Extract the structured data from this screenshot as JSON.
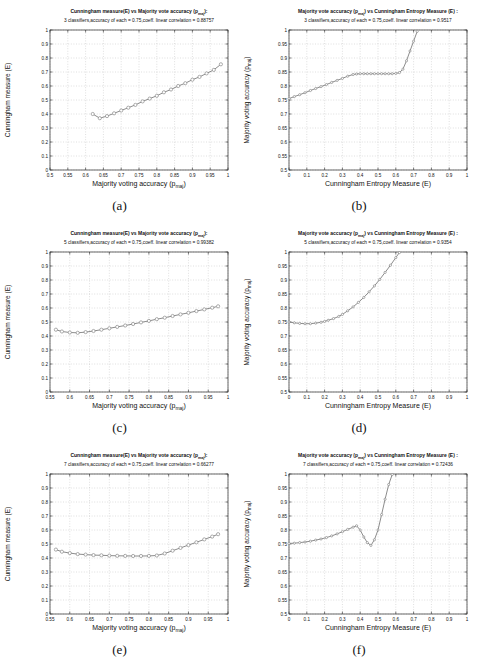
{
  "style": {
    "background": "#ffffff",
    "grid_color": "#bfbfbf",
    "axis_color": "#2a2a2a",
    "curve_color": "#6e6e6e",
    "marker_fill": "#ffffff",
    "marker_stroke": "#8a8a8a",
    "text_color": "#111111"
  },
  "chart_data": [
    {
      "type": "line",
      "caption": "(a)",
      "title_line1": "Cunningham measure(E) vs Majority vote accuracy (p_maj):",
      "title_line2": "3 classifiers,accuracy of each = 0.75,coeff. linear correlation = 0.88757",
      "xlabel": "Majority voting accuracy (p_maj)",
      "ylabel": "Cunningham measure (E)",
      "xlim": [
        0.5,
        1
      ],
      "ylim": [
        0,
        1
      ],
      "xticks": [
        0.5,
        0.55,
        0.6,
        0.65,
        0.7,
        0.75,
        0.8,
        0.85,
        0.9,
        0.95,
        1
      ],
      "yticks": [
        0,
        0.1,
        0.2,
        0.3,
        0.4,
        0.5,
        0.6,
        0.7,
        0.8,
        0.9,
        1
      ],
      "marker_r": 1.6,
      "points": [
        [
          0.62,
          0.4
        ],
        [
          0.64,
          0.37
        ],
        [
          0.66,
          0.385
        ],
        [
          0.68,
          0.405
        ],
        [
          0.7,
          0.425
        ],
        [
          0.72,
          0.445
        ],
        [
          0.74,
          0.465
        ],
        [
          0.76,
          0.49
        ],
        [
          0.78,
          0.51
        ],
        [
          0.8,
          0.53
        ],
        [
          0.82,
          0.555
        ],
        [
          0.84,
          0.575
        ],
        [
          0.86,
          0.6
        ],
        [
          0.88,
          0.62
        ],
        [
          0.9,
          0.645
        ],
        [
          0.92,
          0.665
        ],
        [
          0.94,
          0.69
        ],
        [
          0.96,
          0.715
        ],
        [
          0.98,
          0.755
        ]
      ]
    },
    {
      "type": "line",
      "caption": "(b)",
      "title_line1": "Majority vote accuracy (p_maj) vs Cunningham Entropy Measure (E) :",
      "title_line2": "3 classifiers,accuracy of each = 0.75,coeff. linear correlation = 0.9517",
      "xlabel": "Cunningham Entropy Measure (E)",
      "ylabel": "Majority voting accuracy (p_maj)",
      "xlim": [
        0,
        1
      ],
      "ylim": [
        0.5,
        1
      ],
      "xticks": [
        0,
        0.1,
        0.2,
        0.3,
        0.4,
        0.5,
        0.6,
        0.7,
        0.8,
        0.9,
        1
      ],
      "yticks": [
        0.5,
        0.55,
        0.6,
        0.65,
        0.7,
        0.75,
        0.8,
        0.85,
        0.9,
        0.95,
        1
      ],
      "marker_r": 1.1,
      "points": [
        [
          0,
          0.755
        ],
        [
          0.03,
          0.762
        ],
        [
          0.06,
          0.769
        ],
        [
          0.09,
          0.776
        ],
        [
          0.12,
          0.784
        ],
        [
          0.15,
          0.791
        ],
        [
          0.18,
          0.798
        ],
        [
          0.21,
          0.805
        ],
        [
          0.24,
          0.813
        ],
        [
          0.27,
          0.82
        ],
        [
          0.3,
          0.827
        ],
        [
          0.33,
          0.835
        ],
        [
          0.36,
          0.841
        ],
        [
          0.38,
          0.843
        ],
        [
          0.4,
          0.844
        ],
        [
          0.42,
          0.844
        ],
        [
          0.44,
          0.844
        ],
        [
          0.46,
          0.844
        ],
        [
          0.48,
          0.844
        ],
        [
          0.5,
          0.844
        ],
        [
          0.52,
          0.844
        ],
        [
          0.54,
          0.844
        ],
        [
          0.56,
          0.844
        ],
        [
          0.58,
          0.844
        ],
        [
          0.6,
          0.845
        ],
        [
          0.62,
          0.848
        ],
        [
          0.64,
          0.86
        ],
        [
          0.66,
          0.89
        ],
        [
          0.68,
          0.925
        ],
        [
          0.7,
          0.96
        ],
        [
          0.72,
          0.995
        ]
      ]
    },
    {
      "type": "line",
      "caption": "(c)",
      "title_line1": "Cunningham measure(E) vs Majority vote accuracy (p_maj):",
      "title_line2": "5 classifiers,accuracy of each = 0.75,coeff. linear correlation = 0.99382",
      "xlabel": "Majority voting accuracy (p_maj)",
      "ylabel": "Cunningham measure (E)",
      "xlim": [
        0.55,
        1
      ],
      "ylim": [
        0,
        1
      ],
      "xticks": [
        0.55,
        0.6,
        0.65,
        0.7,
        0.75,
        0.8,
        0.85,
        0.9,
        0.95,
        1
      ],
      "yticks": [
        0,
        0.1,
        0.2,
        0.3,
        0.4,
        0.5,
        0.6,
        0.7,
        0.8,
        0.9,
        1
      ],
      "marker_r": 1.6,
      "points": [
        [
          0.565,
          0.445
        ],
        [
          0.58,
          0.432
        ],
        [
          0.6,
          0.425
        ],
        [
          0.62,
          0.423
        ],
        [
          0.64,
          0.428
        ],
        [
          0.66,
          0.436
        ],
        [
          0.68,
          0.445
        ],
        [
          0.7,
          0.455
        ],
        [
          0.72,
          0.465
        ],
        [
          0.74,
          0.475
        ],
        [
          0.76,
          0.486
        ],
        [
          0.78,
          0.497
        ],
        [
          0.8,
          0.508
        ],
        [
          0.82,
          0.52
        ],
        [
          0.84,
          0.531
        ],
        [
          0.86,
          0.543
        ],
        [
          0.88,
          0.554
        ],
        [
          0.9,
          0.566
        ],
        [
          0.92,
          0.578
        ],
        [
          0.94,
          0.59
        ],
        [
          0.96,
          0.602
        ],
        [
          0.975,
          0.612
        ]
      ]
    },
    {
      "type": "line",
      "caption": "(d)",
      "title_line1": "Majority vote accuracy (p_maj) vs Cunningham Entropy Measure (E) :",
      "title_line2": "5 classifiers,accuracy of each = 0.75,coeff. linear correlation = 0.9354",
      "xlabel": "Cunningham Entropy Measure (E)",
      "ylabel": "Majority voting accuracy (p_maj)",
      "xlim": [
        0,
        1
      ],
      "ylim": [
        0.5,
        1
      ],
      "xticks": [
        0,
        0.1,
        0.2,
        0.3,
        0.4,
        0.5,
        0.6,
        0.7,
        0.8,
        0.9,
        1
      ],
      "yticks": [
        0.5,
        0.55,
        0.6,
        0.65,
        0.7,
        0.75,
        0.8,
        0.85,
        0.9,
        0.95,
        1
      ],
      "marker_r": 1.1,
      "points": [
        [
          0,
          0.75
        ],
        [
          0.03,
          0.747
        ],
        [
          0.06,
          0.745
        ],
        [
          0.09,
          0.744
        ],
        [
          0.12,
          0.744
        ],
        [
          0.15,
          0.746
        ],
        [
          0.18,
          0.749
        ],
        [
          0.2,
          0.752
        ],
        [
          0.22,
          0.756
        ],
        [
          0.25,
          0.762
        ],
        [
          0.28,
          0.77
        ],
        [
          0.3,
          0.777
        ],
        [
          0.33,
          0.79
        ],
        [
          0.36,
          0.804
        ],
        [
          0.39,
          0.82
        ],
        [
          0.42,
          0.838
        ],
        [
          0.45,
          0.858
        ],
        [
          0.48,
          0.879
        ],
        [
          0.51,
          0.902
        ],
        [
          0.54,
          0.927
        ],
        [
          0.57,
          0.953
        ],
        [
          0.6,
          0.98
        ],
        [
          0.62,
          0.998
        ]
      ]
    },
    {
      "type": "line",
      "caption": "(e)",
      "title_line1": "Cunningham measure(E) vs Majority vote accuracy (p_maj):",
      "title_line2": "7 classifiers,accuracy of each = 0.75,coeff. linear correlation = 0.66277",
      "xlabel": "Majority voting accuracy (p_maj)",
      "ylabel": "Cunningham measure (E)",
      "xlim": [
        0.55,
        1
      ],
      "ylim": [
        0,
        1
      ],
      "xticks": [
        0.55,
        0.6,
        0.65,
        0.7,
        0.75,
        0.8,
        0.85,
        0.9,
        0.95,
        1
      ],
      "yticks": [
        0,
        0.1,
        0.2,
        0.3,
        0.4,
        0.5,
        0.6,
        0.7,
        0.8,
        0.9,
        1
      ],
      "marker_r": 1.6,
      "points": [
        [
          0.565,
          0.46
        ],
        [
          0.58,
          0.445
        ],
        [
          0.6,
          0.435
        ],
        [
          0.62,
          0.428
        ],
        [
          0.64,
          0.424
        ],
        [
          0.66,
          0.421
        ],
        [
          0.68,
          0.419
        ],
        [
          0.7,
          0.417
        ],
        [
          0.72,
          0.416
        ],
        [
          0.74,
          0.415
        ],
        [
          0.76,
          0.414
        ],
        [
          0.78,
          0.414
        ],
        [
          0.8,
          0.415
        ],
        [
          0.82,
          0.418
        ],
        [
          0.84,
          0.432
        ],
        [
          0.86,
          0.452
        ],
        [
          0.88,
          0.472
        ],
        [
          0.9,
          0.492
        ],
        [
          0.92,
          0.512
        ],
        [
          0.94,
          0.533
        ],
        [
          0.96,
          0.553
        ],
        [
          0.975,
          0.57
        ]
      ]
    },
    {
      "type": "line",
      "caption": "(f)",
      "title_line1": "Majority vote accuracy (p_maj) vs Cunningham Entropy Measure (E) :",
      "title_line2": "7 classifiers,accuracy of each = 0.75,coeff. linear correlation = 0.72436",
      "xlabel": "Cunningham Entropy Measure (E)",
      "ylabel": "Majority voting accuracy (p_maj)",
      "xlim": [
        0,
        1
      ],
      "ylim": [
        0.5,
        1
      ],
      "xticks": [
        0,
        0.1,
        0.2,
        0.3,
        0.4,
        0.5,
        0.6,
        0.7,
        0.8,
        0.9,
        1
      ],
      "yticks": [
        0.5,
        0.55,
        0.6,
        0.65,
        0.7,
        0.75,
        0.8,
        0.85,
        0.9,
        0.95,
        1
      ],
      "marker_r": 1.1,
      "points": [
        [
          0,
          0.752
        ],
        [
          0.03,
          0.753
        ],
        [
          0.06,
          0.755
        ],
        [
          0.09,
          0.757
        ],
        [
          0.12,
          0.76
        ],
        [
          0.15,
          0.764
        ],
        [
          0.18,
          0.768
        ],
        [
          0.21,
          0.773
        ],
        [
          0.24,
          0.779
        ],
        [
          0.27,
          0.786
        ],
        [
          0.3,
          0.794
        ],
        [
          0.33,
          0.802
        ],
        [
          0.36,
          0.81
        ],
        [
          0.38,
          0.815
        ],
        [
          0.4,
          0.8
        ],
        [
          0.42,
          0.775
        ],
        [
          0.44,
          0.755
        ],
        [
          0.46,
          0.745
        ],
        [
          0.48,
          0.765
        ],
        [
          0.5,
          0.8
        ],
        [
          0.52,
          0.855
        ],
        [
          0.54,
          0.91
        ],
        [
          0.56,
          0.962
        ],
        [
          0.58,
          0.998
        ]
      ]
    }
  ]
}
